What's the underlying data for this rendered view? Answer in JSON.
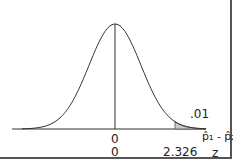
{
  "chart_data": {
    "type": "area",
    "title": "",
    "mean": 0,
    "critical_value": 2.326,
    "tail_area": ".01",
    "xlabel_top": "p̂₁ - p̂₂",
    "xlabel_bottom": "z",
    "ticks_top": [
      "0"
    ],
    "ticks_bottom": [
      "0",
      "2.326"
    ],
    "shade_color": "#c8c8c8",
    "line_color": "#333333"
  },
  "labels": {
    "tail_area": ".01",
    "center_top": "0",
    "center_bottom": "0",
    "critical": "2.326",
    "axis_top": "p̂₁ - p̂₂",
    "axis_bottom": "z"
  }
}
